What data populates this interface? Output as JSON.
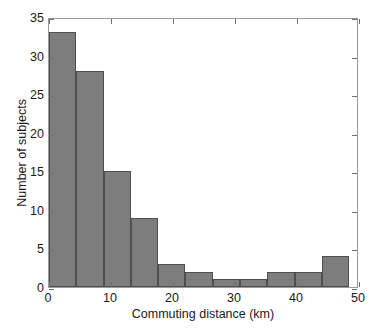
{
  "chart_data": {
    "type": "bar",
    "title": "",
    "subtitle": "",
    "xlabel": "Commuting distance (km)",
    "ylabel": "Number of subjects",
    "xlim": [
      0,
      50
    ],
    "ylim": [
      0,
      35
    ],
    "grid": false,
    "legend": null,
    "bar_color": "#7d7d7d",
    "bar_edge_color": "#4f4f4f",
    "axis_color": "#9a9a9a",
    "bin_edges": [
      0,
      4.4,
      8.8,
      13.2,
      17.6,
      22.0,
      26.4,
      30.8,
      35.2,
      39.6,
      44.0,
      48.4
    ],
    "bin_centers": [
      2.2,
      6.6,
      11.0,
      15.4,
      19.8,
      24.2,
      28.6,
      33.0,
      37.4,
      41.8,
      46.2
    ],
    "values": [
      33,
      28,
      15,
      9,
      3,
      2,
      1,
      1,
      2,
      2,
      4
    ],
    "categories": [
      "0-4.4",
      "4.4-8.8",
      "8.8-13.2",
      "13.2-17.6",
      "17.6-22",
      "22-26.4",
      "26.4-30.8",
      "30.8-35.2",
      "35.2-39.6",
      "39.6-44",
      "44-48.4"
    ],
    "x_ticks": [
      0,
      10,
      20,
      30,
      40,
      50
    ],
    "x_tick_labels": [
      "0",
      "10",
      "20",
      "30",
      "40",
      "50"
    ],
    "y_ticks": [
      0,
      5,
      10,
      15,
      20,
      25,
      30,
      35
    ],
    "y_tick_labels": [
      "0",
      "5",
      "10",
      "15",
      "20",
      "25",
      "30",
      "35"
    ]
  }
}
